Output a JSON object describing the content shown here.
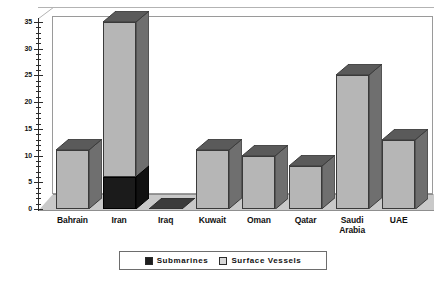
{
  "chart_data": {
    "type": "bar",
    "title": "",
    "subtitle": "",
    "xlabel": "",
    "ylabel": "",
    "ylim": [
      0,
      35
    ],
    "yticks": [
      0,
      5,
      10,
      15,
      20,
      25,
      30,
      35
    ],
    "ytick_labels": [
      "0",
      "5",
      "10",
      "15",
      "20",
      "25",
      "30",
      "35"
    ],
    "minor_tick_step": 1,
    "grid": false,
    "stacked": true,
    "three_d": true,
    "legend_position": "bottom",
    "categories": [
      "Bahrain",
      "Iran",
      "Iraq",
      "Kuwait",
      "Oman",
      "Qatar",
      "Saudi Arabia",
      "UAE"
    ],
    "series": [
      {
        "name": "Submarines",
        "color": "#1b1b1b",
        "values": [
          0,
          6,
          0,
          0,
          0,
          0,
          0,
          0
        ]
      },
      {
        "name": "Surface Vessels",
        "color": "#b6b6b6",
        "values": [
          11,
          29,
          0,
          11,
          10,
          8,
          25,
          13
        ]
      }
    ],
    "totals": [
      11,
      35,
      0,
      11,
      10,
      8,
      25,
      13
    ]
  },
  "axis": {
    "y_tick_labels": [
      "35",
      "30",
      "25",
      "20",
      "15",
      "10",
      "5",
      "0"
    ]
  },
  "x_labels": [
    {
      "line1": "Bahrain",
      "line2": ""
    },
    {
      "line1": "Iran",
      "line2": ""
    },
    {
      "line1": "Iraq",
      "line2": ""
    },
    {
      "line1": "Kuwait",
      "line2": ""
    },
    {
      "line1": "Oman",
      "line2": ""
    },
    {
      "line1": "Qatar",
      "line2": ""
    },
    {
      "line1": "Saudi",
      "line2": "Arabia"
    },
    {
      "line1": "UAE",
      "line2": ""
    }
  ],
  "legend": {
    "items": [
      {
        "label": "Submarines",
        "color": "#1f1f1f"
      },
      {
        "label": "Surface Vessels",
        "color": "#d8d8d8"
      }
    ]
  },
  "colors": {
    "submarines": "#1b1b1b",
    "surface_vessels": "#b6b6b6",
    "floor": "#c9c9c9",
    "frame": "#9a9a9a",
    "background": "#ffffff"
  }
}
